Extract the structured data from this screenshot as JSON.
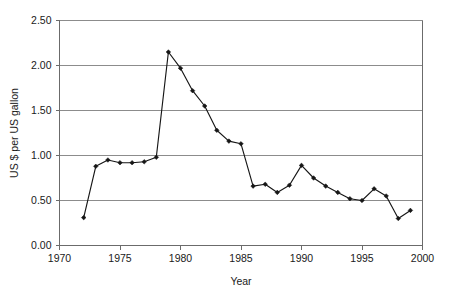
{
  "chart_data": {
    "type": "line",
    "title": "",
    "subtitle": "",
    "xlabel": "Year",
    "ylabel": "US $ per US gallon",
    "xlim": [
      1970,
      2000
    ],
    "ylim": [
      0.0,
      2.5
    ],
    "xticks": [
      1970,
      1975,
      1980,
      1985,
      1990,
      1995,
      2000
    ],
    "xtick_labels": [
      "1970",
      "1975",
      "1980",
      "1985",
      "1990",
      "1995",
      "2000"
    ],
    "yticks": [
      0.0,
      0.5,
      1.0,
      1.5,
      2.0,
      2.5
    ],
    "ytick_labels": [
      "0.00",
      "0.50",
      "1.00",
      "1.50",
      "2.00",
      "2.50"
    ],
    "grid": "horizontal",
    "legend": "none",
    "marker": "diamond",
    "line_color": "#161616",
    "grid_color": "#8c8c8c",
    "x": [
      1972,
      1973,
      1974,
      1975,
      1976,
      1977,
      1978,
      1979,
      1980,
      1981,
      1982,
      1983,
      1984,
      1985,
      1986,
      1987,
      1988,
      1989,
      1990,
      1991,
      1992,
      1993,
      1994,
      1995,
      1996,
      1997,
      1998,
      1999
    ],
    "values": [
      0.31,
      0.88,
      0.95,
      0.92,
      0.92,
      0.93,
      0.98,
      2.15,
      1.97,
      1.72,
      1.55,
      1.28,
      1.16,
      1.13,
      0.66,
      0.68,
      0.59,
      0.67,
      0.89,
      0.75,
      0.66,
      0.59,
      0.52,
      0.5,
      0.63,
      0.55,
      0.3,
      0.39
    ],
    "series": [
      {
        "name": "US $ per US gallon",
        "values": [
          0.31,
          0.88,
          0.95,
          0.92,
          0.92,
          0.93,
          0.98,
          2.15,
          1.97,
          1.72,
          1.55,
          1.28,
          1.16,
          1.13,
          0.66,
          0.68,
          0.59,
          0.67,
          0.89,
          0.75,
          0.66,
          0.59,
          0.52,
          0.5,
          0.63,
          0.55,
          0.3,
          0.39
        ]
      }
    ]
  }
}
